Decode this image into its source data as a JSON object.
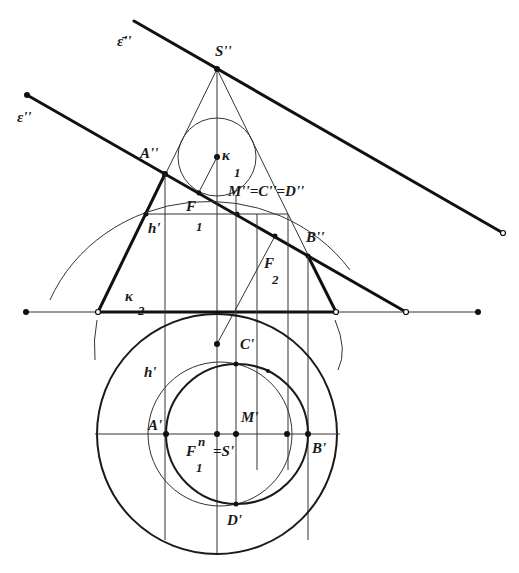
{
  "figure": {
    "labels": {
      "eps_bar": "ε̄''",
      "eps": "ε''",
      "S2": "S''",
      "A2": "A''",
      "K": "κ",
      "K1_sub": "1",
      "M2C2D2": "M''=C''=D''",
      "F": "F",
      "F1_sub": "1",
      "h2": "h'",
      "B2": "B''",
      "F2": "F",
      "F2_sub": "2",
      "K2": "κ",
      "K2_sub": "2",
      "C1": "C'",
      "h1": "h'",
      "A1": "A'",
      "M1": "M'",
      "Fn": "F",
      "Fn_sup": "n",
      "Fn_sub": "1",
      "S1": "=S'",
      "B1": "B'",
      "D1": "D'"
    },
    "colors": {
      "stroke": "#111111",
      "background": "#ffffff"
    }
  }
}
